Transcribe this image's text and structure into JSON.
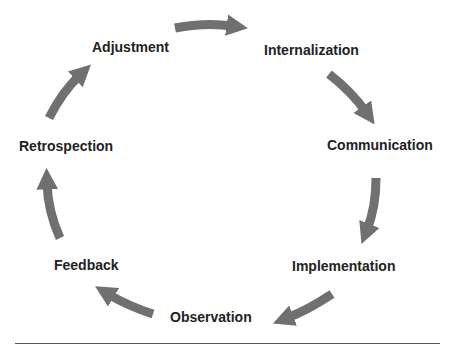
{
  "diagram": {
    "type": "cycle",
    "arrow_color": "#707070",
    "text_color": "#222222",
    "stages": [
      {
        "id": "adjustment",
        "label": "Adjustment"
      },
      {
        "id": "internalization",
        "label": "Internalization"
      },
      {
        "id": "communication",
        "label": "Communication"
      },
      {
        "id": "implementation",
        "label": "Implementation"
      },
      {
        "id": "observation",
        "label": "Observation"
      },
      {
        "id": "feedback",
        "label": "Feedback"
      },
      {
        "id": "retrospection",
        "label": "Retrospection"
      }
    ],
    "edges": [
      {
        "from": "Adjustment",
        "to": "Internalization"
      },
      {
        "from": "Internalization",
        "to": "Communication"
      },
      {
        "from": "Communication",
        "to": "Implementation"
      },
      {
        "from": "Implementation",
        "to": "Observation"
      },
      {
        "from": "Observation",
        "to": "Feedback"
      },
      {
        "from": "Feedback",
        "to": "Retrospection"
      },
      {
        "from": "Retrospection",
        "to": "Adjustment"
      }
    ]
  }
}
